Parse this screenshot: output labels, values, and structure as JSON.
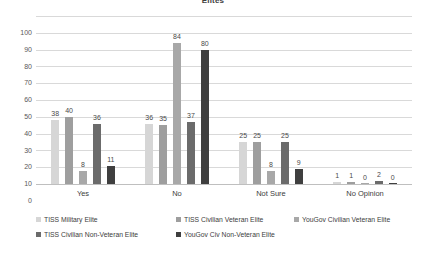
{
  "chart_data": {
    "type": "bar",
    "title": "Elites",
    "xlabel": "",
    "ylabel": "",
    "ylim": [
      0,
      100
    ],
    "ytick_step": 10,
    "yticks": [
      "100",
      "90",
      "80",
      "70",
      "60",
      "50",
      "40",
      "30",
      "20",
      "10",
      "0"
    ],
    "grid": true,
    "legend_position": "bottom",
    "categories": [
      "Yes",
      "No",
      "Not Sure",
      "No Opinion"
    ],
    "series": [
      {
        "name": "TISS Military Elite",
        "color": "#d6d6d6",
        "values": [
          38,
          36,
          25,
          1
        ]
      },
      {
        "name": "TISS Civilian Veteran Elite",
        "color": "#9e9e9e",
        "values": [
          40,
          35,
          25,
          1
        ]
      },
      {
        "name": "YouGov Civilian Veteran Elite",
        "color": "#a8a8a8",
        "values": [
          8,
          84,
          8,
          0
        ]
      },
      {
        "name": "TISS Civilian Non-Veteran Elite",
        "color": "#6b6b6b",
        "values": [
          36,
          37,
          25,
          2
        ]
      },
      {
        "name": "YouGov Civ Non-Veteran Elite",
        "color": "#3f3f3f",
        "values": [
          11,
          80,
          9,
          0
        ]
      }
    ],
    "legend_rows": [
      [
        "TISS Military Elite",
        "TISS Civilian Veteran Elite",
        "YouGov Civilian Veteran Elite"
      ],
      [
        "TISS Civilian Non-Veteran Elite",
        "YouGov Civ Non-Veteran Elite"
      ]
    ]
  }
}
